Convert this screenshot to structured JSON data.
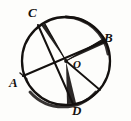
{
  "figure": {
    "kind": "circle-geometry-diagram",
    "background_color": "#fdfdfb",
    "ink_color": "#14110f",
    "circle": {
      "center_x": 66,
      "center_y": 61,
      "radius": 44,
      "stroke_width": 2.2
    },
    "labels": [
      {
        "id": "A",
        "text": "A",
        "x": 9,
        "y": 76,
        "size": "large"
      },
      {
        "id": "B",
        "text": "B",
        "x": 104,
        "y": 31,
        "size": "large"
      },
      {
        "id": "C",
        "text": "C",
        "x": 28,
        "y": 6,
        "size": "large"
      },
      {
        "id": "D",
        "text": "D",
        "x": 72,
        "y": 104,
        "size": "large"
      },
      {
        "id": "O",
        "text": "O",
        "x": 73,
        "y": 59,
        "size": "small"
      }
    ],
    "points": {
      "A": {
        "x": 23,
        "y": 76
      },
      "B": {
        "x": 105,
        "y": 41
      },
      "C": {
        "x": 38,
        "y": 25
      },
      "D": {
        "x": 73,
        "y": 104
      },
      "O": {
        "x": 66,
        "y": 61
      },
      "E": {
        "x": 100,
        "y": 90
      }
    },
    "segments": [
      {
        "name": "chord-A-to-B",
        "from": "A",
        "to": "B",
        "width": 2.0
      },
      {
        "name": "chord-C-to-D",
        "from": "C",
        "to": "D",
        "width": 2.0
      },
      {
        "name": "radius-O-to-E",
        "from": "O",
        "to": "E",
        "width": 1.8
      }
    ],
    "wedges": [
      {
        "name": "wedge-O-to-C",
        "apex": "O",
        "toward": "C",
        "spread_px": 4
      },
      {
        "name": "wedge-O-to-B",
        "apex": "O",
        "toward": "B",
        "spread_px": 4
      },
      {
        "name": "wedge-O-to-D",
        "apex": "O",
        "toward": "D",
        "spread_px": 9
      }
    ]
  }
}
